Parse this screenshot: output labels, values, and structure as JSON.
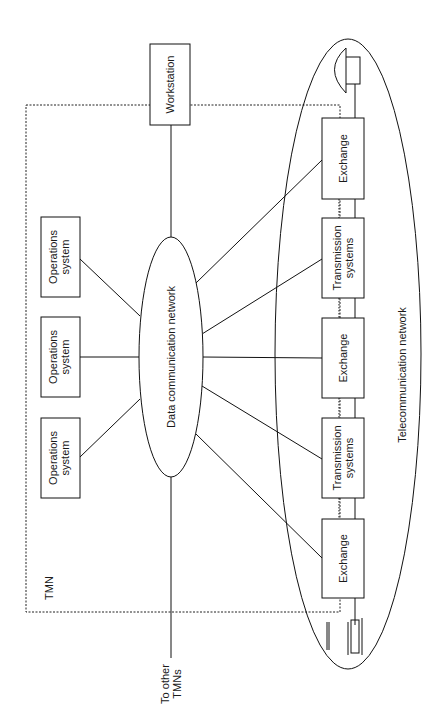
{
  "diagram": {
    "tmn_label": "TMN",
    "to_other_tmns": [
      "To other",
      "TMNs"
    ],
    "workstation": "Workstation",
    "dcn": "Data communication network",
    "telecom_network": "Telecommunication network",
    "operations_systems": [
      [
        "Operations",
        "system"
      ],
      [
        "Operations",
        "system"
      ],
      [
        "Operations",
        "system"
      ]
    ],
    "network_elements": [
      {
        "lines": [
          "Exchange"
        ]
      },
      {
        "lines": [
          "Transmission",
          "systems"
        ]
      },
      {
        "lines": [
          "Exchange"
        ]
      },
      {
        "lines": [
          "Transmission",
          "systems"
        ]
      },
      {
        "lines": [
          "Exchange"
        ]
      }
    ],
    "icons": [
      "telephone-icon",
      "terminal-device-icon"
    ]
  }
}
